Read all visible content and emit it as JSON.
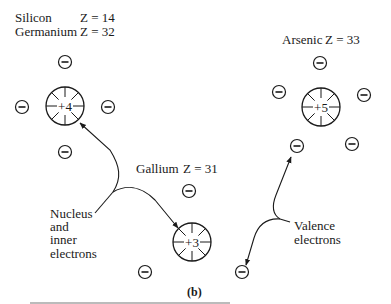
{
  "figure": {
    "sublabel": "(b)",
    "stroke_color": "#1a1a1a",
    "background": "#ffffff"
  },
  "elements": {
    "silicon": {
      "name": "Silicon",
      "z": "Z = 14"
    },
    "germanium": {
      "name": "Germanium",
      "z": "Z = 32"
    },
    "arsenic": {
      "name": "Arsenic",
      "z": "Z = 33"
    },
    "gallium": {
      "name": "Gallium",
      "z": "Z = 31"
    }
  },
  "atoms": [
    {
      "id": "si-ge",
      "charge": "+4",
      "cx": 65,
      "cy": 106,
      "r": 19,
      "electrons": [
        [
          65,
          62
        ],
        [
          22,
          107
        ],
        [
          108,
          107
        ],
        [
          65,
          152
        ]
      ]
    },
    {
      "id": "as",
      "charge": "+5",
      "cx": 321,
      "cy": 107,
      "r": 19,
      "electrons": [
        [
          320,
          63
        ],
        [
          279,
          92
        ],
        [
          364,
          95
        ],
        [
          297,
          146
        ],
        [
          352,
          144
        ]
      ]
    },
    {
      "id": "ga",
      "charge": "+3",
      "cx": 192,
      "cy": 242,
      "r": 19,
      "electrons": [
        [
          189,
          191
        ],
        [
          145,
          272
        ],
        [
          242,
          272
        ]
      ]
    }
  ],
  "annotations": {
    "nucleus_label": [
      "Nucleus",
      "and",
      "inner",
      "electrons"
    ],
    "valence_label": [
      "Valence",
      "electrons"
    ]
  }
}
